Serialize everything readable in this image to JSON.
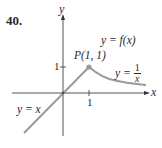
{
  "problem": {
    "number": "40."
  },
  "axes": {
    "x_label": "x",
    "y_label": "y",
    "x_tick": "1",
    "y_tick": "1"
  },
  "labels": {
    "point": "P(1, 1)",
    "function": "y = f(x)",
    "right_piece_prefix": "y =",
    "right_piece_num": "1",
    "right_piece_den": "x",
    "left_piece": "y = x"
  },
  "colors": {
    "curve": "#9a9a9a",
    "axis": "#555555",
    "point": "#9a9a9a"
  }
}
